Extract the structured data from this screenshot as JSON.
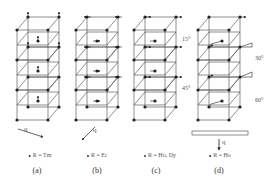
{
  "figure": {
    "panels": [
      {
        "id": "a",
        "caption": "(a)",
        "label": "R = Tm",
        "q_label": "q",
        "moment_direction": "along c (vertical)"
      },
      {
        "id": "b",
        "caption": "(b)",
        "label": "R = Er",
        "q_label": "q",
        "moment_direction": "in-plane, antiparallel layers"
      },
      {
        "id": "c",
        "caption": "(c)",
        "label": "R = Ho, Dy",
        "q_label": "",
        "moment_direction": "in-plane, rotating"
      },
      {
        "id": "d",
        "caption": "(d)",
        "label": "R = Ho",
        "q_label": "q",
        "moment_direction": "in-plane spiral with angles"
      }
    ],
    "angles_c": [
      "15°",
      "45°"
    ],
    "angles_d": [
      "30°",
      "60°"
    ],
    "colors": {
      "line": "#444444",
      "atom": "#222222",
      "text": "#555555"
    }
  }
}
